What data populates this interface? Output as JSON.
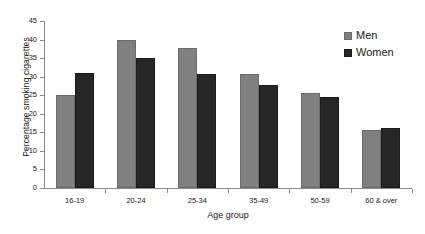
{
  "chart_data": {
    "type": "bar",
    "title": "",
    "xlabel": "Age group",
    "ylabel": "Percentage smoking cigarettes",
    "categories": [
      "16-19",
      "20-24",
      "25-34",
      "35-49",
      "50-59",
      "60 & over"
    ],
    "series": [
      {
        "name": "Men",
        "color": "#808080",
        "values": [
          25,
          40,
          37.8,
          30.8,
          25.6,
          15.6
        ]
      },
      {
        "name": "Women",
        "color": "#262626",
        "values": [
          31,
          35,
          30.8,
          27.8,
          24.6,
          16.3
        ]
      }
    ],
    "ylim": [
      0,
      45
    ],
    "ytick_step": 5,
    "yticks": [
      "45",
      "40",
      "35",
      "30",
      "25",
      "20",
      "15",
      "10",
      "5",
      "0"
    ],
    "grid": false,
    "legend_position": "top-right",
    "background": "#ffffff",
    "axis_color": "#8a8a8a"
  },
  "legend": {
    "items": [
      {
        "label": "Men"
      },
      {
        "label": "Women"
      }
    ]
  }
}
